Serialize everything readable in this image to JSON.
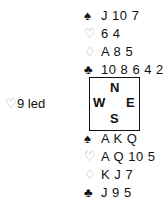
{
  "north": {
    "spades": {
      "symbol": "♠",
      "cards": "J 10 7"
    },
    "hearts": {
      "symbol": "♡",
      "cards": "6 4"
    },
    "diamonds": {
      "symbol": "♢",
      "cards": "A 8 5"
    },
    "clubs": {
      "symbol": "♣",
      "cards": "10 8 6 4 2"
    }
  },
  "south": {
    "spades": {
      "symbol": "♠",
      "cards": "A K Q"
    },
    "hearts": {
      "symbol": "♡",
      "cards": "A Q 10 5"
    },
    "diamonds": {
      "symbol": "♢",
      "cards": "K J 7"
    },
    "clubs": {
      "symbol": "♣",
      "cards": "J 9 5"
    }
  },
  "opening_lead": {
    "symbol": "♡",
    "text": "9 led"
  },
  "compass": {
    "n": "N",
    "w": "W",
    "e": "E",
    "s": "S"
  }
}
